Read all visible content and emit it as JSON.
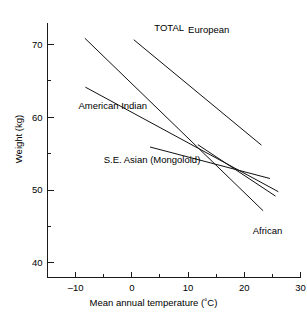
{
  "chart_data": {
    "type": "line",
    "title": "",
    "xlabel": "Mean annual temperature (˚C)",
    "ylabel": "Weight (kg)",
    "xlim": [
      -15,
      30
    ],
    "ylim": [
      38,
      73
    ],
    "grid": false,
    "legend_position": "inline-annotations",
    "x_ticks_major": [
      -10,
      0,
      10,
      20,
      30
    ],
    "x_ticks_major_labels": [
      "–10",
      "0",
      "10",
      "20",
      "30"
    ],
    "x_ticks_minor": [
      -5,
      5,
      15,
      25
    ],
    "y_ticks_major": [
      40,
      50,
      60,
      70
    ],
    "y_ticks_major_labels": [
      "40",
      "50",
      "60",
      "70"
    ],
    "y_ticks_minor": [
      45,
      55,
      65
    ],
    "series": [
      {
        "name": "TOTAL",
        "label": "TOTAL",
        "x": [
          -8.3,
          23.3
        ],
        "y": [
          70.8,
          47.2
        ],
        "label_x": 4.0,
        "label_y": 72.3
      },
      {
        "name": "European",
        "label": "European",
        "x": [
          0.4,
          23.0
        ],
        "y": [
          70.6,
          56.2
        ],
        "label_x": 10.0,
        "label_y": 72.0
      },
      {
        "name": "American Indian",
        "label": "American Indian",
        "x": [
          -8.2,
          26.0
        ],
        "y": [
          64.1,
          49.8
        ],
        "label_x": -9.5,
        "label_y": 61.6
      },
      {
        "name": "S.E. Asian (Mongoloid)",
        "label": "S.E. Asian (Mongoloid)",
        "x": [
          3.3,
          24.5
        ],
        "y": [
          55.9,
          51.6
        ],
        "label_x": -5.0,
        "label_y": 54.2
      },
      {
        "name": "African",
        "label": "African",
        "x": [
          11.8,
          25.5
        ],
        "y": [
          56.2,
          49.2
        ],
        "label_x": 21.5,
        "label_y": 44.4
      }
    ],
    "annotations": [
      "TOTAL",
      "European",
      "American Indian",
      "S.E. Asian (Mongoloid)",
      "African"
    ]
  }
}
